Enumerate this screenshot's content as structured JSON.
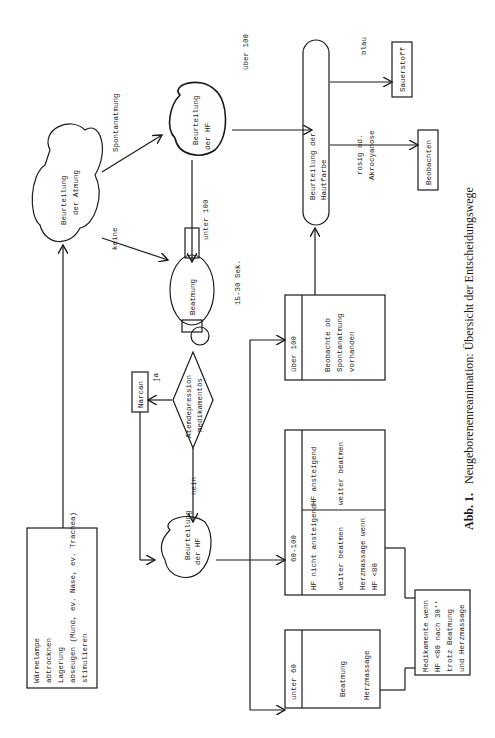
{
  "figure": {
    "caption_label": "Abb. 1.",
    "caption_text": "Neugeborenenreanimation: Übersicht der Entscheidungswege",
    "orientation": "rotated 90° counter-clockwise"
  },
  "nodes": {
    "initial_care": {
      "lines": [
        "Wärmelampe",
        "abtrocknen",
        "Lagerung",
        "abseugen (Mund, ev. Nase, ev. Trachea)",
        "stimulieren"
      ]
    },
    "assess_breathing": {
      "lines": [
        "Beurteilung",
        "der Atmung"
      ]
    },
    "assess_hr_top": {
      "lines": [
        "Beurteilung",
        "der HF"
      ]
    },
    "ventilation_bag": {
      "label": "Beatmung"
    },
    "ventilation_duration": "15-30 Sek.",
    "drug_depression": {
      "lines": [
        "Atemdepression",
        "medikamentös"
      ]
    },
    "narcan": {
      "label": "Narcan"
    },
    "assess_hr_bottom": {
      "lines": [
        "Beurteilung",
        "der HF"
      ]
    },
    "assess_skin": {
      "lines": [
        "Beurteilung der",
        "Hautfarbe"
      ]
    },
    "oxygen": {
      "label": "Sauerstoff"
    },
    "observe": {
      "label": "Beobachten"
    },
    "hr_over_100": {
      "header": "über 100",
      "lines": [
        "Beobachte ob",
        "Spontanatmung",
        "vorhanden"
      ]
    },
    "hr_60_100": {
      "header": "60-100",
      "col_a": {
        "lines": [
          "HF ansteigend",
          "weiter beatmen"
        ]
      },
      "col_b": {
        "lines": [
          "HF nicht ansteigend",
          "weiter beatmen",
          "Herzmassage wenn",
          "HF <80"
        ]
      }
    },
    "hr_under_60": {
      "header": "unter 60",
      "lines": [
        "Beatmung",
        "Herzmassage"
      ]
    },
    "medications": {
      "lines": [
        "Medikamente wenn",
        "HF <80 nach 30''",
        "trotz Beatmung",
        "und Herzmassage"
      ]
    }
  },
  "edge_labels": {
    "spontaneous": "Spontanatmung",
    "none": "keine",
    "under_100": "unter 100",
    "over_100_top": "über 100",
    "yes": "ja",
    "no": "nein",
    "blue": "blau",
    "pink": "rosig od.",
    "acrocyanosis": "Akrocyanose"
  }
}
